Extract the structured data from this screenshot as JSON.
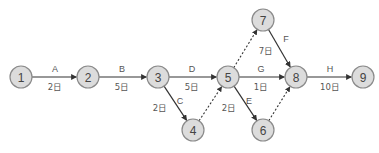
{
  "diagram": {
    "type": "arrow-diagram",
    "nodes": [
      {
        "id": "1",
        "label": "1",
        "x": 21,
        "y": 77
      },
      {
        "id": "2",
        "label": "2",
        "x": 88,
        "y": 77
      },
      {
        "id": "3",
        "label": "3",
        "x": 158,
        "y": 77
      },
      {
        "id": "4",
        "label": "4",
        "x": 193,
        "y": 130
      },
      {
        "id": "5",
        "label": "5",
        "x": 228,
        "y": 77
      },
      {
        "id": "6",
        "label": "6",
        "x": 263,
        "y": 130
      },
      {
        "id": "7",
        "label": "7",
        "x": 263,
        "y": 20
      },
      {
        "id": "8",
        "label": "8",
        "x": 296,
        "y": 77
      },
      {
        "id": "9",
        "label": "9",
        "x": 363,
        "y": 77
      }
    ],
    "activities": [
      {
        "name": "A",
        "from": "1",
        "to": "2",
        "duration": "2日",
        "name_pos": [
          55,
          69
        ],
        "dur_pos": [
          55,
          87
        ]
      },
      {
        "name": "B",
        "from": "2",
        "to": "3",
        "duration": "5日",
        "name_pos": [
          122,
          69
        ],
        "dur_pos": [
          122,
          87
        ]
      },
      {
        "name": "C",
        "from": "3",
        "to": "4",
        "duration": "2日",
        "name_pos": [
          180,
          101
        ],
        "dur_pos": [
          160,
          108
        ]
      },
      {
        "name": "D",
        "from": "3",
        "to": "5",
        "duration": "5日",
        "name_pos": [
          192,
          69
        ],
        "dur_pos": [
          192,
          87
        ]
      },
      {
        "name": "E",
        "from": "5",
        "to": "6",
        "duration": "2日",
        "name_pos": [
          249,
          101
        ],
        "dur_pos": [
          229,
          108
        ]
      },
      {
        "name": "F",
        "from": "7",
        "to": "8",
        "duration": "7日",
        "name_pos": [
          286,
          39
        ],
        "dur_pos": [
          266,
          51
        ]
      },
      {
        "name": "G",
        "from": "5",
        "to": "8",
        "duration": "1日",
        "name_pos": [
          261,
          69
        ],
        "dur_pos": [
          261,
          87
        ]
      },
      {
        "name": "H",
        "from": "8",
        "to": "9",
        "duration": "10日",
        "name_pos": [
          330,
          69
        ],
        "dur_pos": [
          330,
          87
        ]
      }
    ],
    "dummies": [
      {
        "from": "4",
        "to": "5"
      },
      {
        "from": "5",
        "to": "7"
      },
      {
        "from": "6",
        "to": "8"
      }
    ],
    "node_radius": 11,
    "colors": {
      "node_fill": "#dcdcdc",
      "node_stroke": "#8a8a8a",
      "edge": "#333333",
      "text": "#555555"
    }
  }
}
